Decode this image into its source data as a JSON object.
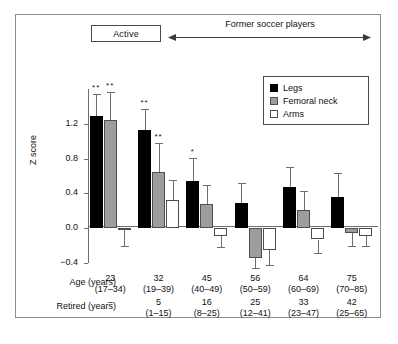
{
  "header": {
    "active_label": "Active",
    "former_label": "Former soccer players"
  },
  "legend": {
    "position": "top-right",
    "items": [
      {
        "label": "Legs",
        "color": "#000000",
        "key": "legs"
      },
      {
        "label": "Femoral neck",
        "color": "#9d9d9d",
        "key": "femoral"
      },
      {
        "label": "Arms",
        "color": "#ffffff",
        "key": "arms"
      }
    ]
  },
  "table": {
    "rows": [
      {
        "label": "Age (years)",
        "values": [
          "23",
          "32",
          "45",
          "56",
          "64",
          "75"
        ],
        "ranges": [
          "(17–34)",
          "(19–39)",
          "(40–49)",
          "(50–59)",
          "(60–69)",
          "(70–85)"
        ]
      },
      {
        "label": "Retired (years)",
        "values": [
          "–",
          "5",
          "16",
          "25",
          "33",
          "42"
        ],
        "ranges": [
          "",
          "(1–15)",
          "(8–25)",
          "(12–41)",
          "(23–47)",
          "(25–65)"
        ]
      }
    ]
  },
  "chart_data": {
    "type": "bar",
    "title": "",
    "xlabel": "",
    "ylabel": "Z score",
    "ylim": [
      -0.4,
      1.6
    ],
    "yticks": [
      1.2,
      0.8,
      0.4,
      0.0,
      -0.4
    ],
    "ytick_labels": [
      "1.2",
      "0.8",
      "0.4",
      "0.0",
      "−0.4"
    ],
    "grid": false,
    "zero_line": true,
    "categories": [
      "23",
      "32",
      "45",
      "56",
      "64",
      "75"
    ],
    "category_sublabels": [
      "(17–34)",
      "(19–39)",
      "(40–49)",
      "(50–59)",
      "(60–69)",
      "(70–85)"
    ],
    "series": [
      {
        "name": "Legs",
        "color": "#000000",
        "values": [
          1.29,
          1.13,
          0.54,
          0.29,
          0.47,
          0.36
        ],
        "err_upper": [
          1.54,
          1.37,
          0.81,
          0.52,
          0.7,
          0.64
        ],
        "err_lower": [
          1.29,
          1.13,
          0.54,
          0.29,
          0.47,
          0.36
        ],
        "significance": [
          "**",
          "**",
          "*",
          "",
          "",
          ""
        ]
      },
      {
        "name": "Femoral neck",
        "color": "#9d9d9d",
        "values": [
          1.24,
          0.65,
          0.28,
          -0.34,
          0.21,
          -0.05
        ],
        "err_upper": [
          1.56,
          0.98,
          0.5,
          -0.34,
          0.43,
          -0.05
        ],
        "err_lower": [
          1.24,
          0.65,
          0.28,
          -0.46,
          0.21,
          -0.2
        ],
        "significance": [
          "**",
          "**",
          "",
          "",
          "",
          ""
        ]
      },
      {
        "name": "Arms",
        "color": "#ffffff",
        "values": [
          -0.01,
          0.32,
          -0.09,
          -0.25,
          -0.13,
          -0.09
        ],
        "err_upper": [
          -0.01,
          0.55,
          -0.09,
          -0.25,
          -0.13,
          -0.09
        ],
        "err_lower": [
          -0.21,
          0.32,
          -0.22,
          -0.42,
          -0.29,
          -0.2
        ],
        "significance": [
          "",
          "",
          "",
          "",
          "",
          ""
        ]
      }
    ]
  }
}
